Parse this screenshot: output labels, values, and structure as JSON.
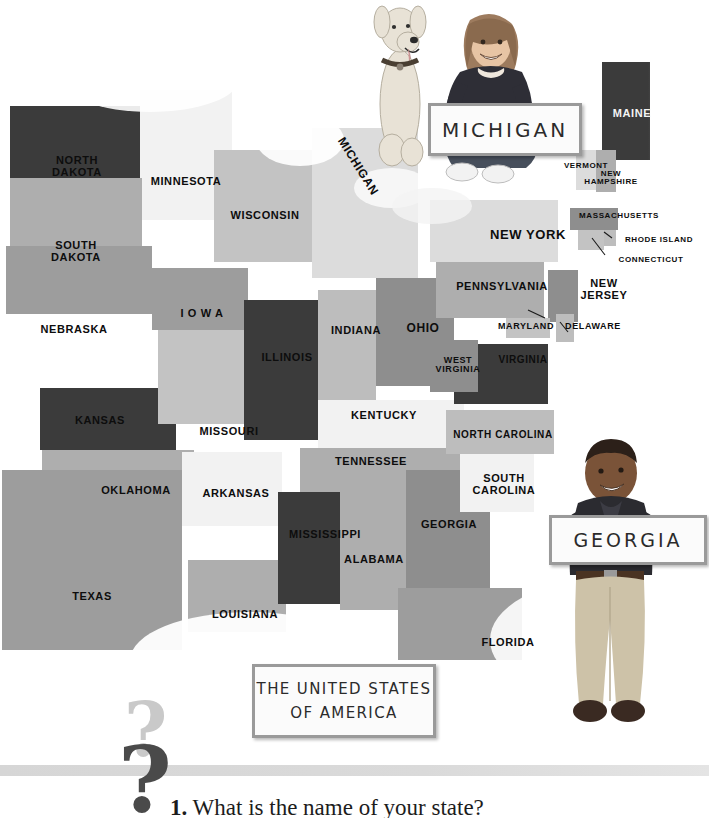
{
  "page": {
    "title": "The United States of America",
    "question_number": "1.",
    "question_text": "What is the name of your state?"
  },
  "signs": {
    "michigan": "MICHIGAN",
    "georgia": "GEORGIA",
    "title_line1": "THE UNITED STATES",
    "title_line2": "OF AMERICA"
  },
  "photos": {
    "girl_with_dog": "girl-and-dog-holding-michigan-sign",
    "boy": "boy-holding-georgia-sign"
  },
  "map": {
    "states": [
      {
        "name": "NORTH DAKOTA",
        "label": "NORTH\nDAKOTA",
        "tone": "dark",
        "x": 10,
        "y": 106,
        "w": 130,
        "h": 72,
        "lx": 22,
        "ly": 155,
        "lw": 110,
        "fs": 11
      },
      {
        "name": "MINNESOTA",
        "label": "MINNESOTA",
        "tone": "white",
        "x": 140,
        "y": 90,
        "w": 92,
        "h": 130,
        "lx": 133,
        "ly": 176,
        "lw": 106,
        "fs": 11
      },
      {
        "name": "SOUTH DAKOTA",
        "label": "SOUTH\nDAKOTA",
        "tone": "grey",
        "x": 10,
        "y": 178,
        "w": 132,
        "h": 68,
        "lx": 22,
        "ly": 240,
        "lw": 108,
        "fs": 11
      },
      {
        "name": "NEBRASKA",
        "label": "NEBRASKA",
        "tone": "mid2",
        "x": 6,
        "y": 246,
        "w": 146,
        "h": 68,
        "lx": 12,
        "ly": 324,
        "lw": 124,
        "fs": 11
      },
      {
        "name": "KANSAS",
        "label": "KANSAS",
        "tone": "dark",
        "x": 40,
        "y": 388,
        "w": 136,
        "h": 62,
        "lx": 40,
        "ly": 415,
        "lw": 120,
        "fs": 11
      },
      {
        "name": "OKLAHOMA",
        "label": "OKLAHOMA",
        "tone": "grey",
        "x": 42,
        "y": 450,
        "w": 152,
        "h": 60,
        "lx": 80,
        "ly": 485,
        "lw": 112,
        "fs": 11
      },
      {
        "name": "TEXAS",
        "label": "TEXAS",
        "tone": "mid2",
        "x": 2,
        "y": 470,
        "w": 180,
        "h": 180,
        "lx": 42,
        "ly": 591,
        "lw": 100,
        "fs": 11
      },
      {
        "name": "IOWA",
        "label": "I O W A",
        "tone": "mid2",
        "x": 152,
        "y": 268,
        "w": 96,
        "h": 62,
        "lx": 158,
        "ly": 308,
        "lw": 88,
        "fs": 11
      },
      {
        "name": "MISSOURI",
        "label": "MISSOURI",
        "tone": "light",
        "x": 158,
        "y": 330,
        "w": 110,
        "h": 94,
        "lx": 174,
        "ly": 426,
        "lw": 110,
        "fs": 11
      },
      {
        "name": "ARKANSAS",
        "label": "ARKANSAS",
        "tone": "white",
        "x": 182,
        "y": 452,
        "w": 100,
        "h": 74,
        "lx": 180,
        "ly": 488,
        "lw": 112,
        "fs": 11
      },
      {
        "name": "LOUISIANA",
        "label": "LOUISIANA",
        "tone": "grey",
        "x": 188,
        "y": 560,
        "w": 98,
        "h": 72,
        "lx": 190,
        "ly": 609,
        "lw": 110,
        "fs": 11
      },
      {
        "name": "WISCONSIN",
        "label": "WISCONSIN",
        "tone": "light",
        "x": 214,
        "y": 150,
        "w": 110,
        "h": 112,
        "lx": 208,
        "ly": 210,
        "lw": 114,
        "fs": 11
      },
      {
        "name": "ILLINOIS",
        "label": "ILLINOIS",
        "tone": "dark",
        "x": 244,
        "y": 300,
        "w": 76,
        "h": 140,
        "lx": 238,
        "ly": 352,
        "lw": 98,
        "fs": 11
      },
      {
        "name": "MICHIGAN",
        "label": "MICHIGAN",
        "tone": "pale",
        "x": 312,
        "y": 128,
        "w": 106,
        "h": 150,
        "lx": 308,
        "ly": 160,
        "lw": 100,
        "fs": 12,
        "rot": 58
      },
      {
        "name": "INDIANA",
        "label": "INDIANA",
        "tone": "grey2",
        "x": 318,
        "y": 290,
        "w": 58,
        "h": 120,
        "lx": 310,
        "ly": 325,
        "lw": 92,
        "fs": 11
      },
      {
        "name": "OHIO",
        "label": "OHIO",
        "tone": "mid",
        "x": 376,
        "y": 278,
        "w": 78,
        "h": 108,
        "lx": 386,
        "ly": 322,
        "lw": 74,
        "fs": 12
      },
      {
        "name": "KENTUCKY",
        "label": "KENTUCKY",
        "tone": "white",
        "x": 318,
        "y": 400,
        "w": 146,
        "h": 56,
        "lx": 326,
        "ly": 410,
        "lw": 116,
        "fs": 11
      },
      {
        "name": "TENNESSEE",
        "label": "TENNESSEE",
        "tone": "grey",
        "x": 300,
        "y": 448,
        "w": 168,
        "h": 44,
        "lx": 310,
        "ly": 456,
        "lw": 122,
        "fs": 11
      },
      {
        "name": "MISSISSIPPI",
        "label": "MISSISSIPPI",
        "tone": "dark",
        "x": 278,
        "y": 492,
        "w": 62,
        "h": 112,
        "lx": 268,
        "ly": 529,
        "lw": 114,
        "fs": 11
      },
      {
        "name": "ALABAMA",
        "label": "ALABAMA",
        "tone": "grey",
        "x": 340,
        "y": 492,
        "w": 66,
        "h": 118,
        "lx": 322,
        "ly": 554,
        "lw": 104,
        "fs": 11
      },
      {
        "name": "GEORGIA",
        "label": "GEORGIA",
        "tone": "mid",
        "x": 406,
        "y": 470,
        "w": 84,
        "h": 118,
        "lx": 402,
        "ly": 519,
        "lw": 94,
        "fs": 11
      },
      {
        "name": "FLORIDA",
        "label": "FLORIDA",
        "tone": "mid2",
        "x": 398,
        "y": 588,
        "w": 124,
        "h": 72,
        "lx": 462,
        "ly": 637,
        "lw": 92,
        "fs": 11
      },
      {
        "name": "SOUTH CAROLINA",
        "label": "SOUTH\nCAROLINA",
        "tone": "white",
        "x": 460,
        "y": 450,
        "w": 74,
        "h": 62,
        "lx": 456,
        "ly": 473,
        "lw": 96,
        "fs": 11
      },
      {
        "name": "NORTH CAROLINA",
        "label": "NORTH CAROLINA",
        "tone": "grey2",
        "x": 446,
        "y": 410,
        "w": 108,
        "h": 44,
        "lx": 447,
        "ly": 430,
        "lw": 112,
        "fs": 10
      },
      {
        "name": "VIRGINIA",
        "label": "VIRGINIA",
        "tone": "dark",
        "x": 454,
        "y": 344,
        "w": 94,
        "h": 60,
        "lx": 481,
        "ly": 355,
        "lw": 84,
        "fs": 10
      },
      {
        "name": "WEST VIRGINIA",
        "label": "WEST\nVIRGINIA",
        "tone": "mid",
        "x": 430,
        "y": 340,
        "w": 48,
        "h": 52,
        "lx": 424,
        "ly": 356,
        "lw": 68,
        "fs": 9
      },
      {
        "name": "PENNSYLVANIA",
        "label": "PENNSYLVANIA",
        "tone": "grey",
        "x": 436,
        "y": 262,
        "w": 108,
        "h": 56,
        "lx": 443,
        "ly": 281,
        "lw": 118,
        "fs": 11
      },
      {
        "name": "NEW YORK",
        "label": "NEW YORK",
        "tone": "pale",
        "x": 430,
        "y": 200,
        "w": 128,
        "h": 62,
        "lx": 480,
        "ly": 228,
        "lw": 96,
        "fs": 13
      },
      {
        "name": "NEW JERSEY",
        "label": "NEW\nJERSEY",
        "tone": "mid",
        "x": 548,
        "y": 270,
        "w": 30,
        "h": 52,
        "lx": 574,
        "ly": 278,
        "lw": 60,
        "fs": 11
      },
      {
        "name": "MARYLAND",
        "label": "MARYLAND",
        "tone": "light",
        "x": 506,
        "y": 318,
        "w": 44,
        "h": 20,
        "lx": 494,
        "ly": 322,
        "lw": 64,
        "fs": 9
      },
      {
        "name": "DELAWARE",
        "label": "DELAWARE",
        "tone": "grey2",
        "x": 556,
        "y": 314,
        "w": 18,
        "h": 28,
        "lx": 562,
        "ly": 322,
        "lw": 62,
        "fs": 9
      },
      {
        "name": "MAINE",
        "label": "MAINE",
        "tone": "dark",
        "x": 602,
        "y": 62,
        "w": 48,
        "h": 98,
        "lx": 604,
        "ly": 108,
        "lw": 56,
        "fs": 11,
        "dark": true
      },
      {
        "name": "VERMONT",
        "label": "VERMONT",
        "tone": "pale",
        "x": 576,
        "y": 150,
        "w": 20,
        "h": 40,
        "lx": 556,
        "ly": 162,
        "lw": 60,
        "fs": 8
      },
      {
        "name": "NEW HAMPSHIRE",
        "label": "NEW\nHAMPSHIRE",
        "tone": "grey",
        "x": 596,
        "y": 150,
        "w": 20,
        "h": 42,
        "lx": 580,
        "ly": 170,
        "lw": 62,
        "fs": 8
      },
      {
        "name": "MASSACHUSETTS",
        "label": "MASSACHUSETTS",
        "tone": "mid",
        "x": 570,
        "y": 208,
        "w": 48,
        "h": 22,
        "lx": 577,
        "ly": 212,
        "lw": 84,
        "fs": 8
      },
      {
        "name": "RHODE ISLAND",
        "label": "RHODE ISLAND",
        "tone": "grey2",
        "x": 604,
        "y": 230,
        "w": 12,
        "h": 16,
        "lx": 620,
        "ly": 236,
        "lw": 78,
        "fs": 8
      },
      {
        "name": "CONNECTICUT",
        "label": "CONNECTICUT",
        "tone": "light",
        "x": 578,
        "y": 230,
        "w": 26,
        "h": 20,
        "lx": 612,
        "ly": 256,
        "lw": 78,
        "fs": 8
      }
    ]
  }
}
